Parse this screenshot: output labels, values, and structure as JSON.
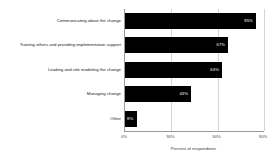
{
  "chart_data": {
    "type": "bar",
    "orientation": "horizontal",
    "title": "",
    "xlabel": "Percent of respondents",
    "ylabel": "",
    "categories": [
      "Communicating about the change",
      "Training others and providing implementation support",
      "Leading and role modeling the change",
      "Managing change",
      "Other"
    ],
    "values": [
      85,
      67,
      63,
      43,
      8
    ],
    "value_labels": [
      "85%",
      "67%",
      "63%",
      "43%",
      "8%"
    ],
    "xlim": [
      0,
      90
    ],
    "xticks": [
      0,
      30,
      60,
      90
    ],
    "xtick_labels": [
      "0%",
      "30%",
      "60%",
      "90%"
    ],
    "grid": true,
    "legend": "none",
    "bar_color": "#000000",
    "value_label_color": "#ffffff",
    "gridline_color": "#d5d5d5",
    "axis_color": "#9a9a9a",
    "background_color": "#ffffff"
  }
}
